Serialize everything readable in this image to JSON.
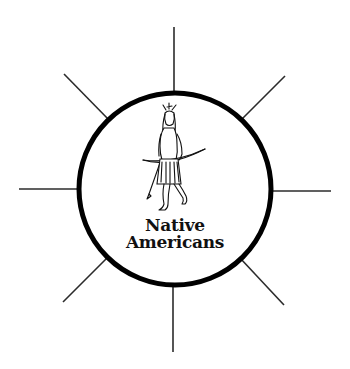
{
  "diagram": {
    "type": "hub-and-spoke",
    "hub": {
      "label_line_1": "Native",
      "label_line_2": "Americans",
      "illustration": "native-american-figure-with-bow-and-arrow"
    },
    "spokes": [
      {
        "direction": "north",
        "label": ""
      },
      {
        "direction": "north-east",
        "label": ""
      },
      {
        "direction": "east",
        "label": ""
      },
      {
        "direction": "south-east",
        "label": ""
      },
      {
        "direction": "south",
        "label": ""
      },
      {
        "direction": "south-west",
        "label": ""
      },
      {
        "direction": "west",
        "label": ""
      },
      {
        "direction": "north-west",
        "label": ""
      }
    ],
    "colors": {
      "ring": "#000000",
      "spokes": "#2b2b2b",
      "background": "#ffffff",
      "text": "#111111"
    }
  }
}
